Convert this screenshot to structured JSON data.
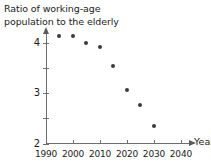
{
  "chart_data": {
    "type": "scatter",
    "title": "Ratio of working-age\npopulation to the elderly",
    "xlabel": "Year",
    "ylabel": "",
    "xlim": [
      1990,
      2043
    ],
    "ylim": [
      2,
      4.25
    ],
    "grid": false,
    "legend": null,
    "x_ticks": [
      {
        "value": 1990,
        "label": "1990"
      },
      {
        "value": 2000,
        "label": "2000"
      },
      {
        "value": 2010,
        "label": "2010"
      },
      {
        "value": 2020,
        "label": "2020"
      },
      {
        "value": 2030,
        "label": "2030"
      },
      {
        "value": 2040,
        "label": "2040"
      }
    ],
    "y_ticks": [
      {
        "value": 4,
        "label": "4"
      },
      {
        "value": 3.5,
        "label": ""
      },
      {
        "value": 3,
        "label": "3"
      },
      {
        "value": 2.5,
        "label": ""
      },
      {
        "value": 2,
        "label": "2"
      }
    ],
    "x": [
      1995,
      2000,
      2005,
      2010,
      2015,
      2020,
      2025,
      2030
    ],
    "values": [
      4.13,
      4.13,
      4.0,
      3.92,
      3.55,
      3.07,
      2.77,
      2.35
    ],
    "points": [
      {
        "x": 1995,
        "y": 4.13
      },
      {
        "x": 2000,
        "y": 4.13
      },
      {
        "x": 2005,
        "y": 4.0
      },
      {
        "x": 2010,
        "y": 3.92
      },
      {
        "x": 2015,
        "y": 3.55
      },
      {
        "x": 2020,
        "y": 3.07
      },
      {
        "x": 2025,
        "y": 2.77
      },
      {
        "x": 2030,
        "y": 2.35
      }
    ],
    "marker_color": "#3b3b3b",
    "axis_color": "#6e6e6e"
  }
}
